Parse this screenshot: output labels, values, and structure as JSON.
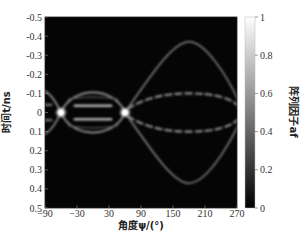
{
  "chart_data": {
    "type": "heatmap",
    "title": "",
    "xlabel": "角度ψ/(°)",
    "ylabel": "时间t/ns",
    "colorbar_label": "阵列因子af",
    "xlim": [
      -90,
      270
    ],
    "ylim": [
      -0.5,
      0.5
    ],
    "y_inverted": true,
    "clim": [
      0,
      1
    ],
    "colormap": "gray",
    "grid": false,
    "x_ticks": [
      -90,
      -30,
      30,
      90,
      150,
      210,
      270
    ],
    "y_ticks": [
      -0.5,
      -0.4,
      -0.3,
      -0.2,
      -0.1,
      0,
      0.1,
      0.2,
      0.3,
      0.4,
      0.5
    ],
    "colorbar_ticks": [
      0,
      0.2,
      0.4,
      0.6,
      0.8,
      1
    ],
    "features": [
      {
        "name": "peak",
        "x": -60,
        "y": 0,
        "value": 1.0
      },
      {
        "name": "peak",
        "x": 60,
        "y": 0,
        "value": 1.0
      },
      {
        "name": "lobe-outer-left",
        "x_range": [
          -60,
          60
        ],
        "y_extent": 0.12,
        "value": 0.45
      },
      {
        "name": "lobe-inner-bars",
        "x_range": [
          -35,
          35
        ],
        "y": [
          -0.035,
          0.035
        ],
        "value": 0.55
      },
      {
        "name": "arc-outer",
        "x_range": [
          60,
          270
        ],
        "y_peak": 0.37,
        "apex_x": 180,
        "value": 0.4
      },
      {
        "name": "arc-inner-dashed",
        "x_range": [
          60,
          270
        ],
        "y_peak": 0.1,
        "apex_x": 180,
        "value": 0.45
      }
    ]
  },
  "axes": {
    "xlabel": "角度ψ/(°)",
    "ylabel": "时间t/ns",
    "colorbar_label": "阵列因子af"
  }
}
